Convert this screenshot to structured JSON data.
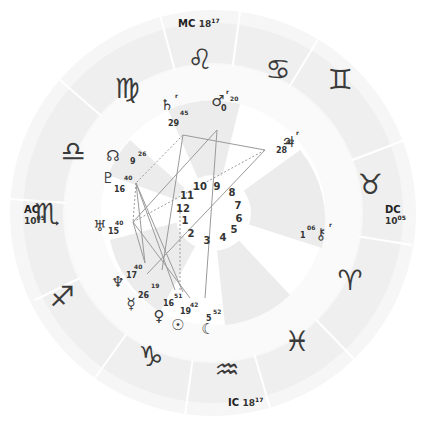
{
  "angles": {
    "mc": {
      "label": "MC",
      "deg": "18",
      "min": "17"
    },
    "ic": {
      "label": "IC",
      "deg": "18",
      "min": "17"
    },
    "ac": {
      "label": "AC",
      "deg": "10",
      "min": "05"
    },
    "dc": {
      "label": "DC",
      "deg": "10",
      "min": "05"
    }
  },
  "signs": [
    {
      "name": "scorpio",
      "glyph": "♏",
      "x": 47,
      "y": 214
    },
    {
      "name": "sagittarius",
      "glyph": "♐",
      "x": 62,
      "y": 297
    },
    {
      "name": "capricorn",
      "glyph": "♑",
      "x": 151,
      "y": 357
    },
    {
      "name": "aquarius",
      "glyph": "♒",
      "x": 227,
      "y": 370
    },
    {
      "name": "pisces",
      "glyph": "♓",
      "x": 297,
      "y": 342
    },
    {
      "name": "aries",
      "glyph": "♈",
      "x": 350,
      "y": 281
    },
    {
      "name": "taurus",
      "glyph": "♉",
      "x": 370,
      "y": 185
    },
    {
      "name": "gemini",
      "glyph": "♊",
      "x": 340,
      "y": 80
    },
    {
      "name": "cancer",
      "glyph": "♋",
      "x": 278,
      "y": 70
    },
    {
      "name": "leo",
      "glyph": "♌",
      "x": 200,
      "y": 60
    },
    {
      "name": "virgo",
      "glyph": "♍",
      "x": 127,
      "y": 89
    },
    {
      "name": "libra",
      "glyph": "♎",
      "x": 73,
      "y": 152
    }
  ],
  "planets": [
    {
      "name": "saturn",
      "glyph": "♄",
      "x": 167,
      "y": 105,
      "deg": "29",
      "min": "45",
      "retro": "r",
      "dx": 168,
      "dy": 120,
      "mx": 180,
      "my": 110
    },
    {
      "name": "mars",
      "glyph": "♂",
      "x": 218,
      "y": 101,
      "deg": "0",
      "min": "20",
      "retro": "r",
      "dx": 221,
      "dy": 105,
      "mx": 230,
      "my": 96
    },
    {
      "name": "jupiter",
      "glyph": "♃",
      "x": 288,
      "y": 142,
      "deg": "28",
      "min": "42",
      "retro": "r",
      "dx": 276,
      "dy": 147,
      "mx": 286,
      "my": 139
    },
    {
      "name": "north-node",
      "glyph": "☊",
      "x": 113,
      "y": 156,
      "deg": "9",
      "min": "26",
      "retro": "",
      "dx": 130,
      "dy": 158,
      "mx": 138,
      "my": 151
    },
    {
      "name": "pluto",
      "glyph": "♇",
      "x": 108,
      "y": 178,
      "deg": "16",
      "min": "40",
      "retro": "",
      "dx": 114,
      "dy": 186,
      "mx": 124,
      "my": 175
    },
    {
      "name": "uranus",
      "glyph": "♅",
      "x": 100,
      "y": 226,
      "deg": "15",
      "min": "40",
      "retro": "",
      "dx": 108,
      "dy": 228,
      "mx": 115,
      "my": 220
    },
    {
      "name": "neptune",
      "glyph": "♆",
      "x": 118,
      "y": 282,
      "deg": "17",
      "min": "40",
      "retro": "",
      "dx": 126,
      "dy": 272,
      "mx": 134,
      "my": 264
    },
    {
      "name": "mercury",
      "glyph": "☿",
      "x": 131,
      "y": 304,
      "deg": "26",
      "min": "19",
      "retro": "",
      "dx": 138,
      "dy": 292,
      "mx": 151,
      "my": 283
    },
    {
      "name": "venus",
      "glyph": "♀",
      "x": 159,
      "y": 316,
      "deg": "16",
      "min": "51",
      "retro": "",
      "dx": 163,
      "dy": 300,
      "mx": 174,
      "my": 293
    },
    {
      "name": "sun",
      "glyph": "☉",
      "x": 178,
      "y": 325,
      "deg": "19",
      "min": "42",
      "retro": "",
      "dx": 180,
      "dy": 308,
      "mx": 190,
      "my": 302
    },
    {
      "name": "moon",
      "glyph": "☾",
      "x": 208,
      "y": 329,
      "deg": "5",
      "min": "52",
      "retro": "",
      "dx": 206,
      "dy": 315,
      "mx": 213,
      "my": 309
    },
    {
      "name": "chiron",
      "glyph": "⚷",
      "x": 321,
      "y": 234,
      "deg": "1",
      "min": "06",
      "retro": "r",
      "dx": 300,
      "dy": 232,
      "mx": 307,
      "my": 225
    }
  ],
  "houses": [
    {
      "n": "1",
      "x": 185,
      "y": 221
    },
    {
      "n": "2",
      "x": 191,
      "y": 234
    },
    {
      "n": "3",
      "x": 207,
      "y": 241
    },
    {
      "n": "4",
      "x": 223,
      "y": 238
    },
    {
      "n": "5",
      "x": 234,
      "y": 230
    },
    {
      "n": "6",
      "x": 239,
      "y": 219
    },
    {
      "n": "7",
      "x": 238,
      "y": 206
    },
    {
      "n": "8",
      "x": 232,
      "y": 193
    },
    {
      "n": "9",
      "x": 217,
      "y": 187
    },
    {
      "n": "10",
      "x": 200,
      "y": 187
    },
    {
      "n": "11",
      "x": 187,
      "y": 196
    },
    {
      "n": "12",
      "x": 183,
      "y": 209
    }
  ],
  "colors": {
    "outer_ring": "#f4f4f4",
    "zodiac_band": "#ededed",
    "inner_wedge": "#ebebeb",
    "aspect_line": "#9a9a9a",
    "glyph": "#3a3a3a"
  }
}
